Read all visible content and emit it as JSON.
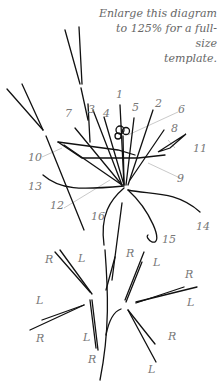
{
  "note": {
    "line1": "Enlarge this diagram",
    "line2": "to 125% for a full-size",
    "line3": "template."
  },
  "part_labels": [
    "1",
    "2",
    "3",
    "4",
    "5",
    "6",
    "7",
    "8",
    "9",
    "10",
    "11",
    "12",
    "13",
    "14",
    "15",
    "16"
  ],
  "side_labels": {
    "L": "L",
    "R": "R"
  }
}
